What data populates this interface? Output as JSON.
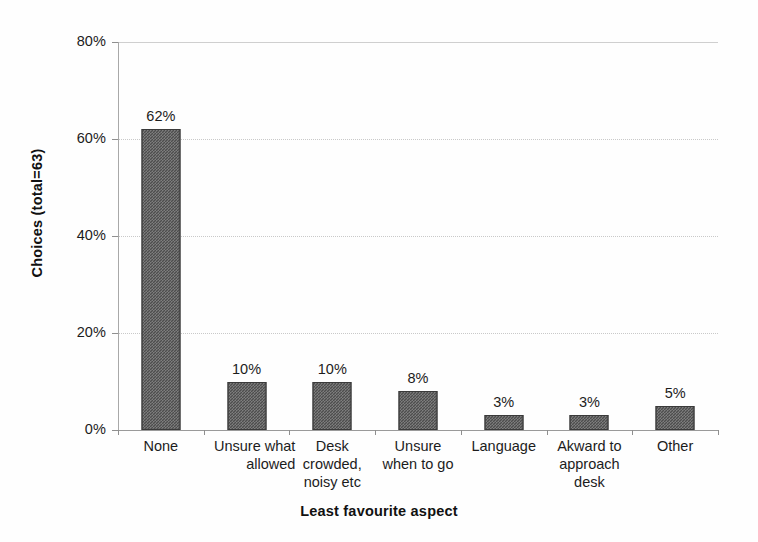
{
  "chart_data": {
    "type": "bar",
    "title": "",
    "xlabel": "Least favourite aspect",
    "ylabel": "Choices (total=63)",
    "categories": [
      "None",
      "Unsure what allowed",
      "Desk crowded, noisy etc",
      "Unsure when to go",
      "Language",
      "Akward to approach desk",
      "Other"
    ],
    "category_lines": [
      [
        "None"
      ],
      [
        "Unsure what",
        "allowed"
      ],
      [
        "Desk",
        "crowded,",
        "noisy etc"
      ],
      [
        "Unsure",
        "when to go"
      ],
      [
        "Language"
      ],
      [
        "Akward to",
        "approach",
        "desk"
      ],
      [
        "Other"
      ]
    ],
    "values": [
      62,
      10,
      10,
      8,
      3,
      3,
      5
    ],
    "value_labels": [
      "62%",
      "10%",
      "10%",
      "8%",
      "3%",
      "3%",
      "5%"
    ],
    "ylim": [
      0,
      80
    ],
    "ytick_values": [
      0,
      20,
      40,
      60,
      80
    ],
    "ytick_labels": [
      "0%",
      "20%",
      "40%",
      "60%",
      "80%"
    ],
    "grid": "horizontal-dotted",
    "legend": "none",
    "bar_color": "#4d4d4d",
    "gridline_color": "#c9c9c9",
    "axis_color": "#8f8f8f"
  }
}
